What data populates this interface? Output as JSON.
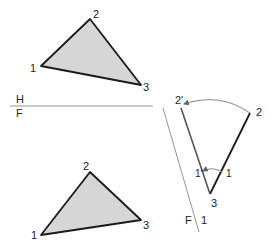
{
  "top_view": {
    "label_plane": "H",
    "vertices": [
      {
        "label": "1"
      },
      {
        "label": "2"
      },
      {
        "label": "3"
      }
    ]
  },
  "folding_line_hf": {
    "upper_label": "H",
    "lower_label": "F"
  },
  "front_view": {
    "vertices": [
      {
        "label": "1"
      },
      {
        "label": "2"
      },
      {
        "label": "3"
      }
    ]
  },
  "auxiliary_view": {
    "folding_line": {
      "label_left": "F",
      "label_right": "1"
    },
    "points": {
      "p2": "2",
      "p2_rotated": "2′",
      "p3": "3",
      "p1": "1",
      "p1_rotated": "1′"
    }
  },
  "colors": {
    "fill": "#d6d6d6",
    "edge": "#1a1a1a",
    "construction": "#888888"
  }
}
